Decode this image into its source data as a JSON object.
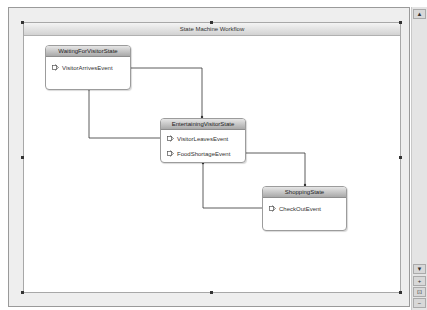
{
  "designer": {
    "title": "State Machine Workflow"
  },
  "states": [
    {
      "name": "WaitingForVisitorState",
      "events": [
        "VisitorArrivesEvent"
      ]
    },
    {
      "name": "EntertainingVisitorState",
      "events": [
        "VisitorLeavesEvent",
        "FoodShortageEvent"
      ]
    },
    {
      "name": "ShoppingState",
      "events": [
        "CheckOutEvent"
      ]
    }
  ],
  "transitions": [
    {
      "from": "VisitorArrivesEvent",
      "to": "EntertainingVisitorState"
    },
    {
      "from": "VisitorLeavesEvent",
      "to": "WaitingForVisitorState"
    },
    {
      "from": "FoodShortageEvent",
      "to": "ShoppingState"
    },
    {
      "from": "CheckOutEvent",
      "to": "EntertainingVisitorState"
    }
  ],
  "scrollbar": {
    "up_arrow": "▲",
    "down_arrow": "▼",
    "zoom_in": "+",
    "zoom_fit": "⊡",
    "zoom_out": "−"
  },
  "colors": {
    "frame_bg": "#eeeeee",
    "canvas_bg": "#ffffff",
    "connector": "#333333",
    "state_header_top": "#e6e6e6",
    "state_header_bottom": "#a9a9a9"
  }
}
